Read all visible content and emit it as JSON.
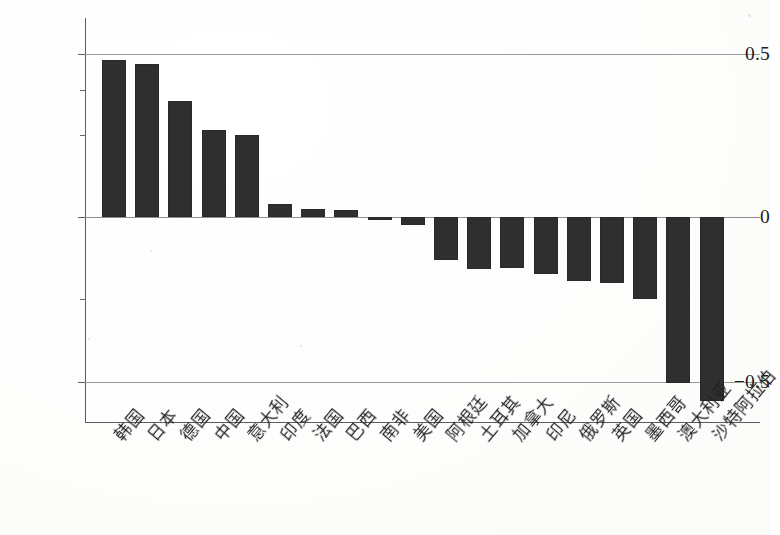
{
  "chart_data": {
    "type": "bar",
    "title": "",
    "subtitle": "",
    "xlabel": "",
    "ylabel": "",
    "ylim": [
      -0.62,
      0.565
    ],
    "yticks": [
      "0.5",
      "0",
      "−0.5"
    ],
    "ytick_values": [
      0.5,
      0,
      -0.5
    ],
    "grid": true,
    "legend": null,
    "bar_color": "#2f2f2f",
    "categories": [
      "韩国",
      "日本",
      "德国",
      "中国",
      "意大利",
      "印度",
      "法国",
      "巴西",
      "南非",
      "美国",
      "阿根廷",
      "土耳其",
      "加拿大",
      "印尼",
      "俄罗斯",
      "英国",
      "墨西哥",
      "澳大利亚",
      "沙特阿拉伯"
    ],
    "values": [
      0.48,
      0.465,
      0.355,
      0.265,
      0.25,
      0.04,
      0.025,
      0.022,
      -0.008,
      -0.025,
      -0.13,
      -0.16,
      -0.155,
      -0.175,
      -0.195,
      -0.2,
      -0.25,
      -0.505,
      -0.56
    ]
  },
  "axis": {
    "y_tick_0": "0.5",
    "y_tick_1": "0",
    "y_tick_2": "−0.5"
  }
}
